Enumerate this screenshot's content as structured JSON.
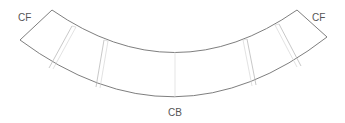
{
  "diagram": {
    "type": "curved-segment-layout",
    "labels": {
      "left_end": "CF",
      "right_end": "CF",
      "center_bottom": "CB"
    },
    "colors": {
      "outline": "#6f6f6f",
      "divider": "#b0b0b0",
      "label": "#555555",
      "background": "#ffffff"
    }
  }
}
